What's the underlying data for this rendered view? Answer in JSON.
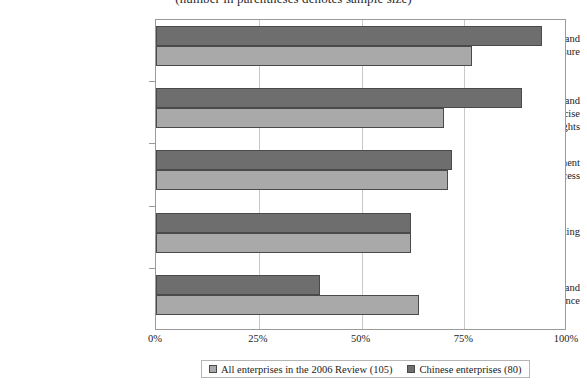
{
  "chart_data": {
    "type": "bar",
    "orientation": "horizontal",
    "title": "(number in parentheses denotes sample size)",
    "xlabel": "",
    "ylabel": "",
    "xlim": [
      0,
      100
    ],
    "xtick_labels": [
      "0%",
      "25%",
      "50%",
      "75%",
      "100%"
    ],
    "xtick_values": [
      0,
      25,
      50,
      75,
      100
    ],
    "grid": true,
    "legend_position": "bottom",
    "categories": [
      "Financial Transparency and Information Disclosure",
      "Ownership Structure and Exercise of Control Rights",
      "Board and Management Structure and Process",
      "Auditing",
      "Corporate Responsibility and Compliance"
    ],
    "series": [
      {
        "name": "All enterprises in the 2006 Review (105)",
        "color": "#a9a9a9",
        "values": [
          77,
          70,
          71,
          62,
          64
        ]
      },
      {
        "name": "Chinese enterprises (80)",
        "color": "#6e6e6e",
        "values": [
          94,
          89,
          72,
          62,
          40
        ]
      }
    ]
  },
  "categories_display": [
    [
      "Financial Transparency and",
      "Information Disclosure"
    ],
    [
      "Ownership Structure and Exercise",
      "of Control Rights"
    ],
    [
      "Board and Management",
      "Structure and Process"
    ],
    [
      "Auditing"
    ],
    [
      "Corporate Responsibility and",
      "Compliance"
    ]
  ],
  "legend": {
    "items": [
      {
        "label": "All enterprises in the 2006 Review (105)",
        "swatch": "light"
      },
      {
        "label": "Chinese enterprises (80)",
        "swatch": "dark"
      }
    ]
  }
}
